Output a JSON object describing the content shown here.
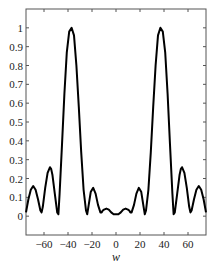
{
  "chart_data": {
    "type": "line",
    "title": "",
    "xlabel": "w",
    "ylabel": "",
    "xlim": [
      -75,
      75
    ],
    "ylim": [
      -0.1,
      1.1
    ],
    "grid": false,
    "legend": null,
    "x_ticks": [
      -60,
      -40,
      -20,
      0,
      20,
      40,
      60
    ],
    "x_tick_labels": [
      "-60",
      "-40",
      "-20",
      "0",
      "20",
      "40",
      "60"
    ],
    "y_ticks": [
      0,
      0.1,
      0.2,
      0.3,
      0.4,
      0.5,
      0.6,
      0.7,
      0.8,
      0.9,
      1
    ],
    "y_tick_labels": [
      "0",
      "0.1",
      "0.2",
      "0.3",
      "0.4",
      "0.5",
      "0.6",
      "0.7",
      "0.8",
      "0.9",
      "1"
    ],
    "series": [
      {
        "name": "response",
        "color": "#000000",
        "x": [
          -75,
          -73,
          -71,
          -69,
          -67,
          -65,
          -63,
          -62,
          -61,
          -59,
          -57,
          -55,
          -54,
          -53,
          -51,
          -49,
          -48,
          -47,
          -45,
          -43,
          -41,
          -39,
          -37,
          -35,
          -33,
          -31,
          -29,
          -27,
          -25,
          -24,
          -23,
          -21,
          -19,
          -17,
          -15,
          -13,
          -12,
          -11,
          -10,
          -8,
          -6,
          -4,
          -2,
          0,
          2,
          4,
          6,
          8,
          10,
          11,
          12,
          13,
          15,
          17,
          19,
          21,
          23,
          24,
          25,
          27,
          29,
          31,
          33,
          35,
          37,
          39,
          41,
          43,
          45,
          47,
          48,
          49,
          51,
          53,
          54,
          55,
          57,
          59,
          61,
          62,
          63,
          65,
          67,
          69,
          71,
          73,
          75
        ],
        "values": [
          0.02,
          0.09,
          0.14,
          0.16,
          0.14,
          0.09,
          0.03,
          0.02,
          0.05,
          0.15,
          0.23,
          0.26,
          0.25,
          0.22,
          0.12,
          0.02,
          0.01,
          0.12,
          0.38,
          0.65,
          0.87,
          0.98,
          1.0,
          0.96,
          0.8,
          0.58,
          0.34,
          0.14,
          0.03,
          0.01,
          0.05,
          0.13,
          0.15,
          0.12,
          0.06,
          0.02,
          0.02,
          0.03,
          0.035,
          0.04,
          0.035,
          0.02,
          0.01,
          0.01,
          0.01,
          0.02,
          0.035,
          0.04,
          0.035,
          0.03,
          0.02,
          0.02,
          0.06,
          0.12,
          0.15,
          0.13,
          0.05,
          0.01,
          0.03,
          0.14,
          0.34,
          0.58,
          0.8,
          0.96,
          1.0,
          0.98,
          0.87,
          0.65,
          0.38,
          0.12,
          0.01,
          0.02,
          0.12,
          0.22,
          0.25,
          0.26,
          0.23,
          0.15,
          0.05,
          0.02,
          0.03,
          0.09,
          0.14,
          0.16,
          0.14,
          0.09,
          0.02
        ]
      }
    ]
  },
  "layout": {
    "frame": {
      "left": 26,
      "top": 9,
      "right": 206,
      "bottom": 235
    },
    "line_color": "#000000",
    "axis_color": "#555555"
  }
}
